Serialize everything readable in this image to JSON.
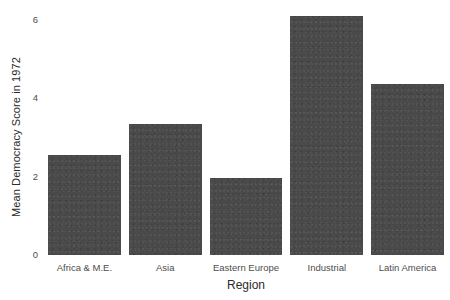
{
  "chart_data": {
    "type": "bar",
    "title": "",
    "subtitle": "",
    "xlabel": "Region",
    "ylabel": "Mean Democracy Score in 1972",
    "categories": [
      "Africa & M.E.",
      "Asia",
      "Eastern Europe",
      "Industrial",
      "Latin America"
    ],
    "values": [
      2.55,
      3.35,
      1.97,
      6.09,
      4.35
    ],
    "series": [
      {
        "name": "Mean Democracy Score in 1972",
        "values": [
          2.55,
          3.35,
          1.97,
          6.09,
          4.35
        ]
      }
    ],
    "ylim": [
      0,
      6.25
    ],
    "xlim": [
      0,
      5
    ],
    "y_ticks": [
      0,
      2,
      4,
      6
    ],
    "y_tick_labels": [
      "0",
      "2",
      "4",
      "6"
    ],
    "x_ticks": [
      "Africa & M.E.",
      "Asia",
      "Eastern Europe",
      "Industrial",
      "Latin America"
    ],
    "grid": false,
    "legend": false,
    "legend_position": "none",
    "bar_color": "#4a4a4a",
    "background_color": "#ffffff",
    "axis_text_color": "#4d4d4d",
    "axis_title_color": "#2b2b2b",
    "orientation": "vertical",
    "bar_width_fraction": 0.9
  },
  "axes": {
    "y_title": "Mean Democracy Score in 1972",
    "x_title": "Region"
  }
}
